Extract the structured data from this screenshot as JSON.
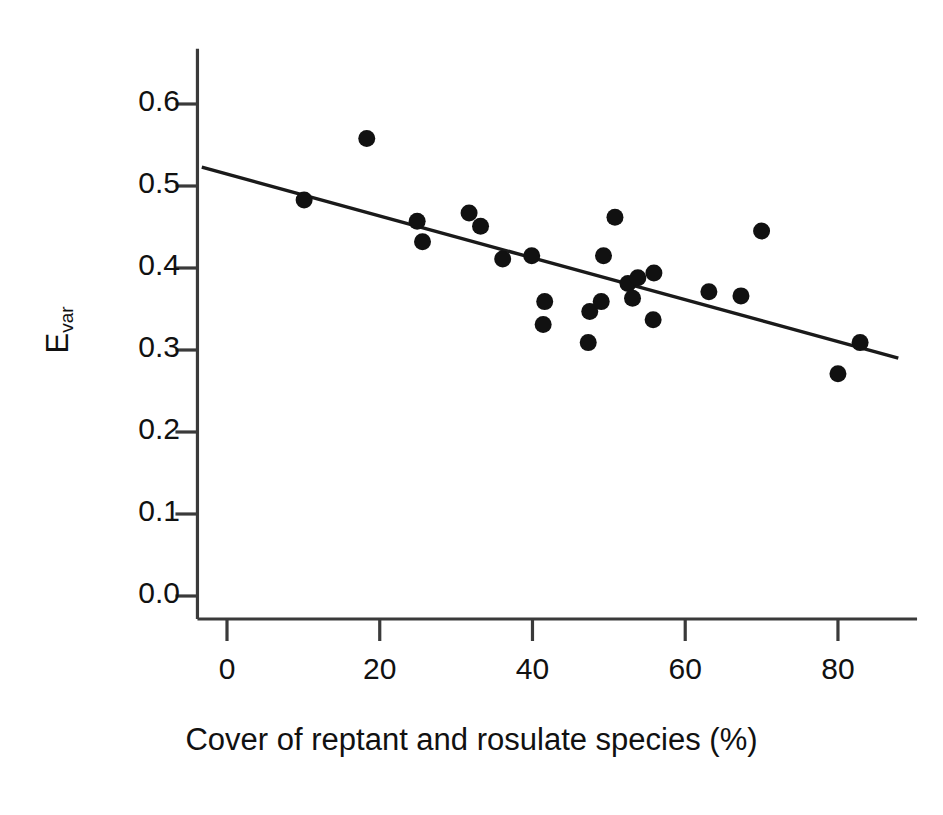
{
  "chart_data": {
    "type": "scatter",
    "title": "",
    "subtitle": "",
    "xlabel": "Cover of reptant and rosulate species (%)",
    "ylabel": "Evar",
    "ylabel_base": "E",
    "ylabel_sub": "var",
    "xlim": [
      -4,
      88
    ],
    "ylim": [
      0.0,
      0.66
    ],
    "xticks": [
      0,
      20,
      40,
      60,
      80
    ],
    "xtick_labels": [
      "0",
      "20",
      "40",
      "60",
      "80"
    ],
    "yticks": [
      0.0,
      0.1,
      0.2,
      0.3,
      0.4,
      0.5,
      0.6
    ],
    "ytick_labels": [
      "0.0",
      "0.1",
      "0.2",
      "0.3",
      "0.4",
      "0.5",
      "0.6"
    ],
    "grid": false,
    "legend": false,
    "marker": "filled-circle",
    "marker_color": "#111111",
    "marker_size": 17,
    "line_color": "#1a1a1a",
    "axis_color": "#3a3a3a",
    "background": "#ffffff",
    "points": [
      {
        "x": 10.1,
        "y": 0.483
      },
      {
        "x": 18.3,
        "y": 0.558
      },
      {
        "x": 24.9,
        "y": 0.457
      },
      {
        "x": 25.6,
        "y": 0.432
      },
      {
        "x": 31.7,
        "y": 0.467
      },
      {
        "x": 33.2,
        "y": 0.451
      },
      {
        "x": 36.1,
        "y": 0.411
      },
      {
        "x": 39.9,
        "y": 0.415
      },
      {
        "x": 41.6,
        "y": 0.359
      },
      {
        "x": 41.4,
        "y": 0.331
      },
      {
        "x": 47.3,
        "y": 0.309
      },
      {
        "x": 47.5,
        "y": 0.347
      },
      {
        "x": 49.0,
        "y": 0.359
      },
      {
        "x": 49.3,
        "y": 0.415
      },
      {
        "x": 50.8,
        "y": 0.462
      },
      {
        "x": 52.5,
        "y": 0.381
      },
      {
        "x": 53.1,
        "y": 0.363
      },
      {
        "x": 53.8,
        "y": 0.388
      },
      {
        "x": 55.9,
        "y": 0.394
      },
      {
        "x": 55.8,
        "y": 0.337
      },
      {
        "x": 63.1,
        "y": 0.371
      },
      {
        "x": 67.3,
        "y": 0.366
      },
      {
        "x": 70.0,
        "y": 0.445
      },
      {
        "x": 80.0,
        "y": 0.271
      },
      {
        "x": 82.9,
        "y": 0.309
      }
    ],
    "trend_line": {
      "type": "linear-regression",
      "x_start": -3.3,
      "y_start": 0.523,
      "x_end": 87.9,
      "y_end": 0.29
    }
  }
}
